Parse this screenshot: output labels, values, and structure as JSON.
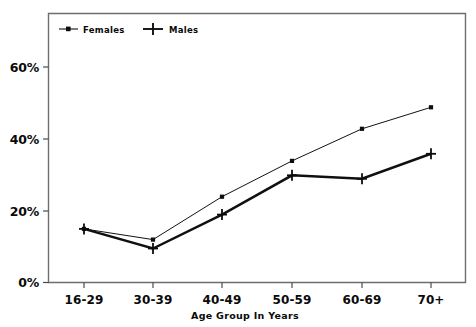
{
  "chart_data": {
    "type": "line",
    "title": "",
    "xlabel": "Age Group In Years",
    "ylabel": "",
    "categories": [
      "16-29",
      "30-39",
      "40-49",
      "50-59",
      "60-69",
      "70+"
    ],
    "series": [
      {
        "name": "Females",
        "marker": "square",
        "values": [
          15,
          12,
          24,
          34,
          43,
          49
        ]
      },
      {
        "name": "Males",
        "marker": "plus",
        "values": [
          15,
          9.5,
          19,
          30,
          29,
          36
        ]
      }
    ],
    "ylim": [
      0,
      70
    ],
    "yticks": [
      0,
      20,
      40,
      60
    ],
    "ytick_labels": [
      "0%",
      "20%",
      "40%",
      "60%"
    ],
    "grid": false,
    "legend_position": "top-left-inside"
  },
  "legend": {
    "entries": [
      {
        "label": "Females",
        "marker": "square"
      },
      {
        "label": "Males",
        "marker": "plus"
      }
    ]
  },
  "axes": {
    "x_title": "Age Group In Years",
    "x_labels": [
      "16-29",
      "30-39",
      "40-49",
      "50-59",
      "60-69",
      "70+"
    ],
    "y_labels": [
      "60%",
      "40%",
      "20%",
      "0%"
    ]
  },
  "colors": {
    "background": "#ffffff",
    "ink": "#0d0d0d",
    "frame": "#6e6e6e",
    "females_line": "#121212",
    "males_line": "#101010"
  }
}
